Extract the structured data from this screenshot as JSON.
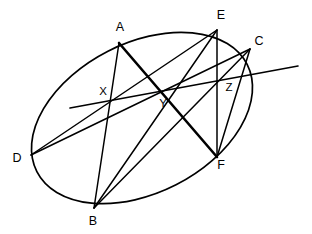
{
  "figure": {
    "background_color": "#ffffff",
    "stroke_color": "#000000",
    "width": 312,
    "height": 234
  },
  "conic": {
    "name": "ellipse",
    "center_x": 142,
    "center_y": 118,
    "radius_x": 118,
    "radius_y": 75,
    "rotation_deg": -27
  },
  "vertices": [
    {
      "id": "A",
      "label": "A",
      "x": 119,
      "y": 43,
      "label_x": 120,
      "label_y": 28
    },
    {
      "id": "B",
      "label": "B",
      "x": 94,
      "y": 208,
      "label_x": 93,
      "label_y": 222
    },
    {
      "id": "C",
      "label": "C",
      "x": 250,
      "y": 49,
      "label_x": 259,
      "label_y": 42
    },
    {
      "id": "D",
      "label": "D",
      "x": 31,
      "y": 155,
      "label_x": 17,
      "label_y": 159
    },
    {
      "id": "E",
      "label": "E",
      "x": 217,
      "y": 30,
      "label_x": 221,
      "label_y": 16
    },
    {
      "id": "F",
      "label": "F",
      "x": 217,
      "y": 157,
      "label_x": 221,
      "label_y": 166
    }
  ],
  "intersections": [
    {
      "id": "X",
      "label": "X",
      "x": 108,
      "y": 104,
      "label_x": 103,
      "label_y": 92
    },
    {
      "id": "Y",
      "label": "Y",
      "x": 162,
      "y": 95,
      "label_x": 163,
      "label_y": 104
    },
    {
      "id": "Z",
      "label": "Z",
      "x": 222,
      "y": 80,
      "label_x": 229,
      "label_y": 88
    }
  ],
  "chords": [
    {
      "id": "AB",
      "from": "A",
      "to": "B",
      "weight": "normal"
    },
    {
      "id": "AF",
      "from": "A",
      "to": "F",
      "weight": "thick"
    },
    {
      "id": "EB",
      "from": "E",
      "to": "B",
      "weight": "normal"
    },
    {
      "id": "EF",
      "from": "E",
      "to": "F",
      "weight": "normal"
    },
    {
      "id": "DE",
      "from": "D",
      "to": "E",
      "weight": "normal"
    },
    {
      "id": "DC",
      "from": "D",
      "to": "C",
      "weight": "normal"
    },
    {
      "id": "CF",
      "from": "C",
      "to": "F",
      "weight": "normal"
    },
    {
      "id": "CB",
      "from": "C",
      "to": "B",
      "weight": "normal"
    }
  ],
  "pascal_line": {
    "id": "XYZ",
    "start_x": 70,
    "start_y": 108,
    "end_x": 298,
    "end_y": 66,
    "passes_through": "X, Y, Z"
  }
}
